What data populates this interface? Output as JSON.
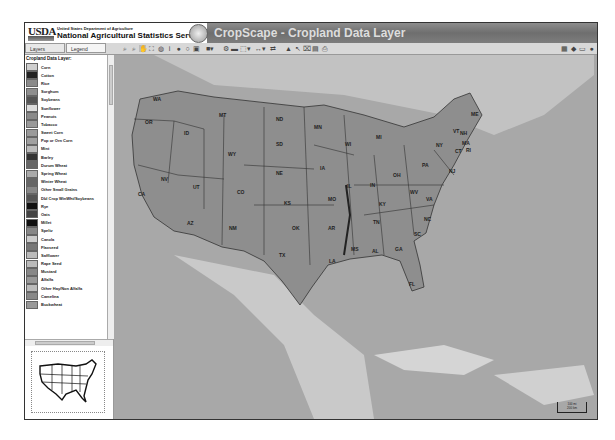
{
  "header": {
    "logo": "USDA",
    "department": "United States Department of Agriculture",
    "agency": "National Agricultural Statistics Service",
    "app_title": "CropScape - Cropland Data Layer"
  },
  "toolbar": {
    "tabs": [
      {
        "label": "Layers"
      },
      {
        "label": "Legend"
      }
    ],
    "tools": [
      "zoom-in-icon",
      "zoom-out-icon",
      "pan-icon",
      "zoom-extent-icon",
      "globe-icon",
      "info-icon",
      "circle-icon",
      "circle-icon",
      "save-icon",
      "layers-dropdown-icon",
      "gear-icon",
      "area-icon",
      "select-dropdown-icon",
      "measure-dropdown-icon",
      "arrow-icon",
      "statistics-icon",
      "cursor-icon",
      "clear-icon",
      "export-icon",
      "print-icon"
    ],
    "right_tools": [
      "grid-icon",
      "diamond-icon",
      "window-icon",
      "help-icon"
    ]
  },
  "legend": {
    "title": "Cropland Data Layer:",
    "items": [
      {
        "label": "Corn",
        "color": "#cfcfcf"
      },
      {
        "label": "Cotton",
        "color": "#222222"
      },
      {
        "label": "Rice",
        "color": "#8a8a8a"
      },
      {
        "label": "Sorghum",
        "color": "#8f8f8f"
      },
      {
        "label": "Soybeans",
        "color": "#555555"
      },
      {
        "label": "Sunflower",
        "color": "#dddddd"
      },
      {
        "label": "Peanuts",
        "color": "#8a8a8a"
      },
      {
        "label": "Tobacco",
        "color": "#999999"
      },
      {
        "label": "Sweet Corn",
        "color": "#9a9a9a"
      },
      {
        "label": "Pop or Orn Corn",
        "color": "#a0a0a0"
      },
      {
        "label": "Mint",
        "color": "#bbbbbb"
      },
      {
        "label": "Barley",
        "color": "#333333"
      },
      {
        "label": "Durum Wheat",
        "color": "#666666"
      },
      {
        "label": "Spring Wheat",
        "color": "#aaaaaa"
      },
      {
        "label": "Winter Wheat",
        "color": "#666666"
      },
      {
        "label": "Other Small Grains",
        "color": "#888888"
      },
      {
        "label": "Dbl Crop WinWht/Soybeans",
        "color": "#555555"
      },
      {
        "label": "Rye",
        "color": "#111111"
      },
      {
        "label": "Oats",
        "color": "#444444"
      },
      {
        "label": "Millet",
        "color": "#111111"
      },
      {
        "label": "Speltz",
        "color": "#888888"
      },
      {
        "label": "Canola",
        "color": "#cccccc"
      },
      {
        "label": "Flaxseed",
        "color": "#777777"
      },
      {
        "label": "Safflower",
        "color": "#bbbbbb"
      },
      {
        "label": "Rape Seed",
        "color": "#bbbbbb"
      },
      {
        "label": "Mustard",
        "color": "#888888"
      },
      {
        "label": "Alfalfa",
        "color": "#999999"
      },
      {
        "label": "Other Hay/Non Alfalfa",
        "color": "#bbbbbb"
      },
      {
        "label": "Camelina",
        "color": "#888888"
      },
      {
        "label": "Buckwheat",
        "color": "#999999"
      }
    ]
  },
  "map": {
    "states": [
      {
        "abbr": "WA",
        "x": 39,
        "y": 41
      },
      {
        "abbr": "OR",
        "x": 31,
        "y": 64
      },
      {
        "abbr": "ID",
        "x": 70,
        "y": 75
      },
      {
        "abbr": "MT",
        "x": 105,
        "y": 57
      },
      {
        "abbr": "WY",
        "x": 114,
        "y": 96
      },
      {
        "abbr": "NV",
        "x": 47,
        "y": 121
      },
      {
        "abbr": "CA",
        "x": 24,
        "y": 136
      },
      {
        "abbr": "UT",
        "x": 79,
        "y": 129
      },
      {
        "abbr": "AZ",
        "x": 73,
        "y": 165
      },
      {
        "abbr": "CO",
        "x": 123,
        "y": 134
      },
      {
        "abbr": "NM",
        "x": 115,
        "y": 170
      },
      {
        "abbr": "ND",
        "x": 162,
        "y": 61
      },
      {
        "abbr": "SD",
        "x": 162,
        "y": 86
      },
      {
        "abbr": "NE",
        "x": 162,
        "y": 115
      },
      {
        "abbr": "KS",
        "x": 170,
        "y": 145
      },
      {
        "abbr": "OK",
        "x": 178,
        "y": 170
      },
      {
        "abbr": "TX",
        "x": 165,
        "y": 197
      },
      {
        "abbr": "MN",
        "x": 200,
        "y": 69
      },
      {
        "abbr": "IA",
        "x": 206,
        "y": 110
      },
      {
        "abbr": "MO",
        "x": 214,
        "y": 141
      },
      {
        "abbr": "AR",
        "x": 214,
        "y": 170
      },
      {
        "abbr": "LA",
        "x": 215,
        "y": 203
      },
      {
        "abbr": "WI",
        "x": 231,
        "y": 86
      },
      {
        "abbr": "IL",
        "x": 233,
        "y": 128
      },
      {
        "abbr": "MI",
        "x": 262,
        "y": 79
      },
      {
        "abbr": "IN",
        "x": 256,
        "y": 127
      },
      {
        "abbr": "OH",
        "x": 279,
        "y": 117
      },
      {
        "abbr": "KY",
        "x": 265,
        "y": 146
      },
      {
        "abbr": "TN",
        "x": 259,
        "y": 164
      },
      {
        "abbr": "MS",
        "x": 237,
        "y": 191
      },
      {
        "abbr": "AL",
        "x": 258,
        "y": 193
      },
      {
        "abbr": "GA",
        "x": 281,
        "y": 191
      },
      {
        "abbr": "FL",
        "x": 295,
        "y": 226
      },
      {
        "abbr": "SC",
        "x": 300,
        "y": 176
      },
      {
        "abbr": "NC",
        "x": 310,
        "y": 161
      },
      {
        "abbr": "VA",
        "x": 312,
        "y": 141
      },
      {
        "abbr": "WV",
        "x": 296,
        "y": 134
      },
      {
        "abbr": "PA",
        "x": 308,
        "y": 107
      },
      {
        "abbr": "NY",
        "x": 322,
        "y": 87
      },
      {
        "abbr": "NJ",
        "x": 335,
        "y": 113
      },
      {
        "abbr": "VT",
        "x": 339,
        "y": 73
      },
      {
        "abbr": "NH",
        "x": 346,
        "y": 75
      },
      {
        "abbr": "MA",
        "x": 348,
        "y": 85
      },
      {
        "abbr": "CT",
        "x": 341,
        "y": 93
      },
      {
        "abbr": "RI",
        "x": 352,
        "y": 92
      },
      {
        "abbr": "ME",
        "x": 357,
        "y": 56
      }
    ],
    "scale": {
      "top": "100 mi",
      "bottom": "200 km"
    }
  }
}
